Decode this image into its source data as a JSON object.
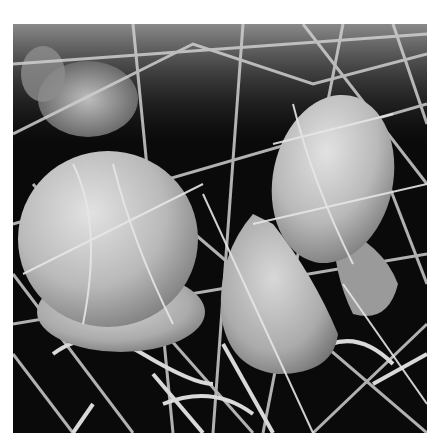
{
  "image": {
    "subject": "scanning electron micrograph of red blood cells caught in fibrin mesh",
    "palette": {
      "background": "#0a0a0a",
      "fiber": "#d6d6d6",
      "cell_light": "#cfcfcf",
      "cell_mid": "#a9a9a9",
      "cell_shadow": "#7a7a7a",
      "page": "#ffffff"
    }
  }
}
